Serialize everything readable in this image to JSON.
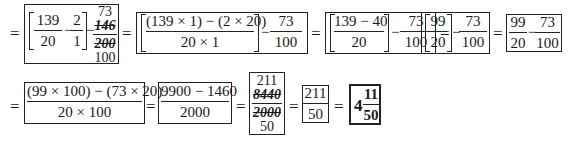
{
  "row1": {
    "step1": {
      "bracket_frac1": {
        "num": "139",
        "den": "20"
      },
      "bracket_frac2": {
        "num": "2",
        "den": "1"
      },
      "minus": "−",
      "cancel_frac": {
        "above": "73",
        "num": "146",
        "den": "200",
        "below": "100"
      }
    },
    "step2": {
      "num": "(139 × 1) − (2 × 20)",
      "den": "20 × 1",
      "minus": "−",
      "frac": {
        "num": "73",
        "den": "100"
      }
    },
    "step3": {
      "num": "139 − 40",
      "den": "20",
      "minus": "−",
      "frac": {
        "num": "73",
        "den": "100"
      }
    },
    "step4": {
      "bracket_frac": {
        "num": "99",
        "den": "20"
      },
      "minus": "−",
      "frac": {
        "num": "73",
        "den": "100"
      }
    },
    "step5": {
      "frac1": {
        "num": "99",
        "den": "20"
      },
      "minus": "−",
      "frac2": {
        "num": "73",
        "den": "100"
      }
    }
  },
  "row2": {
    "step6": {
      "num": "(99 × 100) − (73 × 20)",
      "den": "20 × 100"
    },
    "step7": {
      "num": "9900 − 1460",
      "den": "2000"
    },
    "step8": {
      "above": "211",
      "num": "8440",
      "den": "2000",
      "below": "50"
    },
    "step9": {
      "num": "211",
      "den": "50"
    },
    "answer": {
      "whole": "4",
      "num": "11",
      "den": "50"
    }
  },
  "equals": "="
}
